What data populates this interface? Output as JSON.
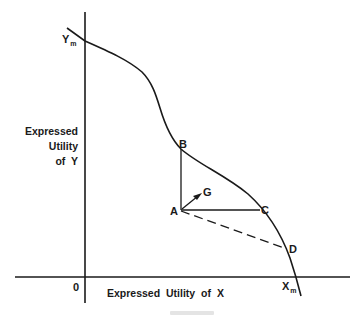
{
  "diagram": {
    "type": "utility possibility frontier",
    "axes": {
      "y_label_lines": [
        "Expressed",
        "Utility",
        "of  Y"
      ],
      "x_label": "Expressed Utility of X",
      "origin_label": "0"
    },
    "curve_endpoints": {
      "y_max": {
        "base": "Y",
        "sub": "m"
      },
      "x_max": {
        "base": "X",
        "sub": "m"
      }
    },
    "points": {
      "A": "A",
      "B": "B",
      "C": "C",
      "D": "D",
      "G": "G"
    },
    "segments": [
      {
        "from": "A",
        "to": "B",
        "style": "solid"
      },
      {
        "from": "A",
        "to": "C",
        "style": "solid"
      },
      {
        "from": "A",
        "to": "D",
        "style": "dashed"
      },
      {
        "from": "A",
        "to": "G",
        "style": "arrow"
      }
    ],
    "colors": {
      "ink": "#1a1a1a",
      "background": "#ffffff"
    }
  }
}
